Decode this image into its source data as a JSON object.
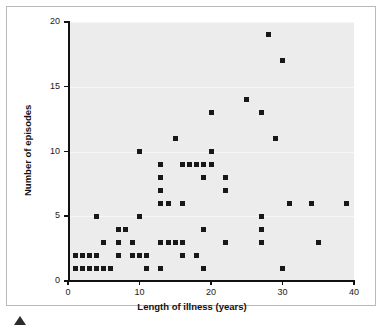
{
  "figure": {
    "kind": "scatter-plot",
    "marker_shape": "square",
    "marker_color": "#18181a",
    "plot_background": "#ececed",
    "frame_color": "#b9b9b9",
    "axis_color": "#111111",
    "triangle_marker": "▲"
  },
  "chart_data": {
    "type": "scatter",
    "title": "",
    "subtitle": "",
    "xlabel": "Length of illness (years)",
    "ylabel": "Number of episodes",
    "xlim": [
      0,
      40
    ],
    "ylim": [
      0,
      20
    ],
    "xticks": [
      0,
      10,
      20,
      30,
      40
    ],
    "yticks": [
      0,
      5,
      10,
      15,
      20
    ],
    "xtick_labels": [
      "0",
      "10",
      "20",
      "30",
      "40"
    ],
    "ytick_labels": [
      "0",
      "5",
      "10",
      "15",
      "20"
    ],
    "grid": "horizontal-faint",
    "legend": "none",
    "annotations": [],
    "series": [
      {
        "name": "patients",
        "marker": "square",
        "color": "#18181a",
        "points": [
          [
            1,
            2
          ],
          [
            1,
            1
          ],
          [
            2,
            1
          ],
          [
            2,
            1
          ],
          [
            2,
            2
          ],
          [
            3,
            1
          ],
          [
            3,
            2
          ],
          [
            4,
            1
          ],
          [
            4,
            2
          ],
          [
            4,
            5
          ],
          [
            5,
            1
          ],
          [
            5,
            3
          ],
          [
            5,
            3
          ],
          [
            6,
            1
          ],
          [
            6,
            1
          ],
          [
            7,
            2
          ],
          [
            7,
            3
          ],
          [
            7,
            4
          ],
          [
            8,
            4
          ],
          [
            9,
            2
          ],
          [
            9,
            3
          ],
          [
            10,
            2
          ],
          [
            10,
            5
          ],
          [
            10,
            10
          ],
          [
            11,
            1
          ],
          [
            11,
            2
          ],
          [
            13,
            1
          ],
          [
            13,
            3
          ],
          [
            13,
            6
          ],
          [
            13,
            7
          ],
          [
            13,
            8
          ],
          [
            13,
            9
          ],
          [
            14,
            3
          ],
          [
            14,
            6
          ],
          [
            14,
            6
          ],
          [
            15,
            3
          ],
          [
            15,
            11
          ],
          [
            16,
            2
          ],
          [
            16,
            3
          ],
          [
            16,
            6
          ],
          [
            16,
            9
          ],
          [
            17,
            9
          ],
          [
            18,
            2
          ],
          [
            18,
            9
          ],
          [
            19,
            1
          ],
          [
            19,
            4
          ],
          [
            19,
            8
          ],
          [
            19,
            9
          ],
          [
            20,
            9
          ],
          [
            20,
            10
          ],
          [
            20,
            13
          ],
          [
            22,
            3
          ],
          [
            22,
            7
          ],
          [
            22,
            8
          ],
          [
            25,
            14
          ],
          [
            27,
            3
          ],
          [
            27,
            4
          ],
          [
            27,
            5
          ],
          [
            27,
            13
          ],
          [
            28,
            19
          ],
          [
            29,
            11
          ],
          [
            29,
            11
          ],
          [
            30,
            1
          ],
          [
            30,
            17
          ],
          [
            31,
            6
          ],
          [
            34,
            6
          ],
          [
            35,
            3
          ],
          [
            39,
            6
          ]
        ]
      }
    ]
  }
}
